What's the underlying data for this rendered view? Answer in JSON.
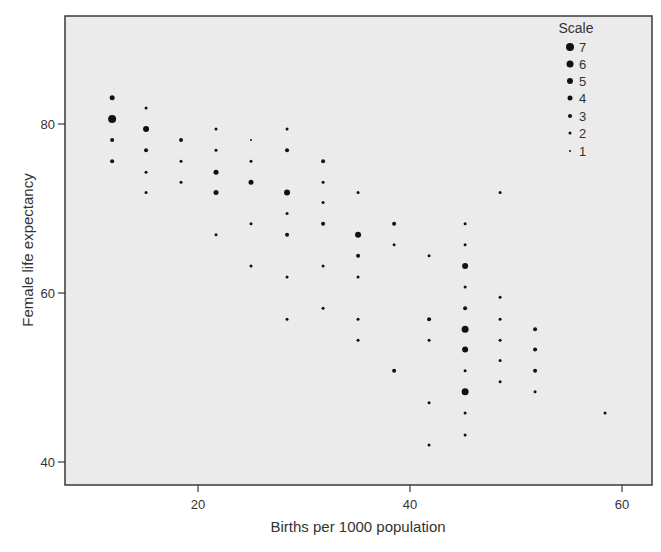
{
  "chart_data": {
    "type": "scatter",
    "title": "",
    "xlabel": "Births per 1000 population",
    "ylabel": "Female life expectancy",
    "xticks": [
      20,
      40,
      60
    ],
    "yticks": [
      40,
      60,
      80
    ],
    "xlim": [
      7.5,
      62.5
    ],
    "ylim": [
      37.2,
      92.8
    ],
    "grid": false,
    "legend": {
      "title": "Scale",
      "position": "top-right inside",
      "entries": [
        7,
        6,
        5,
        4,
        3,
        2,
        1
      ]
    },
    "point_color": "#111111",
    "background_color": "#ebebeb",
    "size_field": "Scale",
    "points": [
      {
        "x": 11.9,
        "y": 83.1,
        "size": 4
      },
      {
        "x": 11.9,
        "y": 80.6,
        "size": 7
      },
      {
        "x": 11.9,
        "y": 78.1,
        "size": 3
      },
      {
        "x": 11.9,
        "y": 75.6,
        "size": 3
      },
      {
        "x": 15.1,
        "y": 81.9,
        "size": 2
      },
      {
        "x": 15.1,
        "y": 79.4,
        "size": 5
      },
      {
        "x": 15.1,
        "y": 76.9,
        "size": 3
      },
      {
        "x": 15.1,
        "y": 74.3,
        "size": 2
      },
      {
        "x": 15.1,
        "y": 71.9,
        "size": 2
      },
      {
        "x": 18.4,
        "y": 78.1,
        "size": 3
      },
      {
        "x": 18.4,
        "y": 75.6,
        "size": 2
      },
      {
        "x": 18.4,
        "y": 73.1,
        "size": 2
      },
      {
        "x": 21.7,
        "y": 79.4,
        "size": 2
      },
      {
        "x": 21.7,
        "y": 76.9,
        "size": 2
      },
      {
        "x": 21.7,
        "y": 74.3,
        "size": 4
      },
      {
        "x": 21.7,
        "y": 71.9,
        "size": 4
      },
      {
        "x": 21.7,
        "y": 66.9,
        "size": 2
      },
      {
        "x": 25.0,
        "y": 78.1,
        "size": 1
      },
      {
        "x": 25.0,
        "y": 75.6,
        "size": 2
      },
      {
        "x": 25.0,
        "y": 73.1,
        "size": 4
      },
      {
        "x": 25.0,
        "y": 68.2,
        "size": 2
      },
      {
        "x": 25.0,
        "y": 63.2,
        "size": 2
      },
      {
        "x": 28.4,
        "y": 79.4,
        "size": 2
      },
      {
        "x": 28.4,
        "y": 76.9,
        "size": 3
      },
      {
        "x": 28.4,
        "y": 71.9,
        "size": 5
      },
      {
        "x": 28.4,
        "y": 69.4,
        "size": 2
      },
      {
        "x": 28.4,
        "y": 66.9,
        "size": 3
      },
      {
        "x": 28.4,
        "y": 61.9,
        "size": 2
      },
      {
        "x": 28.4,
        "y": 56.9,
        "size": 2
      },
      {
        "x": 31.8,
        "y": 75.6,
        "size": 3
      },
      {
        "x": 31.8,
        "y": 73.1,
        "size": 2
      },
      {
        "x": 31.8,
        "y": 70.7,
        "size": 2
      },
      {
        "x": 31.8,
        "y": 68.2,
        "size": 3
      },
      {
        "x": 31.8,
        "y": 63.2,
        "size": 2
      },
      {
        "x": 31.8,
        "y": 58.2,
        "size": 2
      },
      {
        "x": 35.1,
        "y": 71.9,
        "size": 2
      },
      {
        "x": 35.1,
        "y": 66.9,
        "size": 5
      },
      {
        "x": 35.1,
        "y": 64.4,
        "size": 3
      },
      {
        "x": 35.1,
        "y": 61.9,
        "size": 2
      },
      {
        "x": 35.1,
        "y": 56.9,
        "size": 2
      },
      {
        "x": 35.1,
        "y": 54.4,
        "size": 2
      },
      {
        "x": 38.5,
        "y": 68.2,
        "size": 3
      },
      {
        "x": 38.5,
        "y": 65.7,
        "size": 2
      },
      {
        "x": 38.5,
        "y": 50.8,
        "size": 3
      },
      {
        "x": 41.8,
        "y": 64.4,
        "size": 2
      },
      {
        "x": 41.8,
        "y": 56.9,
        "size": 3
      },
      {
        "x": 41.8,
        "y": 54.4,
        "size": 2
      },
      {
        "x": 41.8,
        "y": 47.0,
        "size": 2
      },
      {
        "x": 41.8,
        "y": 42.0,
        "size": 2
      },
      {
        "x": 45.2,
        "y": 68.2,
        "size": 2
      },
      {
        "x": 45.2,
        "y": 65.7,
        "size": 2
      },
      {
        "x": 45.2,
        "y": 63.2,
        "size": 5
      },
      {
        "x": 45.2,
        "y": 60.7,
        "size": 2
      },
      {
        "x": 45.2,
        "y": 58.2,
        "size": 3
      },
      {
        "x": 45.2,
        "y": 55.7,
        "size": 6
      },
      {
        "x": 45.2,
        "y": 53.3,
        "size": 5
      },
      {
        "x": 45.2,
        "y": 50.8,
        "size": 2
      },
      {
        "x": 45.2,
        "y": 48.3,
        "size": 6
      },
      {
        "x": 45.2,
        "y": 45.8,
        "size": 2
      },
      {
        "x": 45.2,
        "y": 43.2,
        "size": 2
      },
      {
        "x": 48.5,
        "y": 71.9,
        "size": 2
      },
      {
        "x": 48.5,
        "y": 59.5,
        "size": 2
      },
      {
        "x": 48.5,
        "y": 56.9,
        "size": 2
      },
      {
        "x": 48.5,
        "y": 54.4,
        "size": 2
      },
      {
        "x": 48.5,
        "y": 52.0,
        "size": 2
      },
      {
        "x": 48.5,
        "y": 49.5,
        "size": 2
      },
      {
        "x": 51.8,
        "y": 55.7,
        "size": 3
      },
      {
        "x": 51.8,
        "y": 53.3,
        "size": 3
      },
      {
        "x": 51.8,
        "y": 50.8,
        "size": 3
      },
      {
        "x": 51.8,
        "y": 48.3,
        "size": 2
      },
      {
        "x": 58.4,
        "y": 45.8,
        "size": 2
      }
    ]
  }
}
